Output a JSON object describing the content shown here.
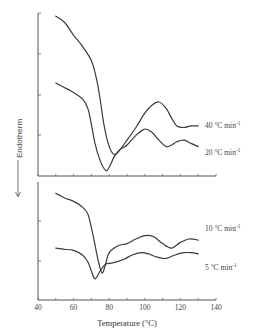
{
  "chart_data": {
    "type": "line",
    "title": "",
    "xlabel": "Temperature (°C)",
    "ylabel": "← Endotherm",
    "xlim": [
      40,
      140
    ],
    "x_ticks": [
      "40",
      "60",
      "80",
      "100",
      "120",
      "140"
    ],
    "grid": false,
    "panels": [
      {
        "position": "top",
        "series": [
          {
            "name": "40 °C min-1",
            "label": "40 °C min",
            "label_sup": "-1",
            "x": [
              50,
              55,
              60,
              65,
              70,
              73,
              75,
              77,
              80,
              83,
              86,
              90,
              95,
              100,
              104,
              108,
              112,
              115,
              118,
              122,
              126,
              130
            ],
            "y_rel": [
              0.98,
              0.94,
              0.86,
              0.79,
              0.7,
              0.58,
              0.45,
              0.3,
              0.16,
              0.11,
              0.14,
              0.2,
              0.28,
              0.37,
              0.42,
              0.44,
              0.4,
              0.34,
              0.29,
              0.28,
              0.29,
              0.29
            ]
          },
          {
            "name": "20 °C min-1",
            "label": "20 °C min",
            "label_sup": "-1",
            "x": [
              50,
              55,
              60,
              65,
              68,
              70,
              72,
              75,
              78,
              80,
              83,
              86,
              90,
              95,
              100,
              104,
              108,
              112,
              115,
              118,
              122,
              126,
              130
            ],
            "y_rel": [
              0.56,
              0.53,
              0.5,
              0.46,
              0.4,
              0.3,
              0.18,
              0.07,
              0.01,
              0.03,
              0.1,
              0.14,
              0.17,
              0.23,
              0.27,
              0.25,
              0.2,
              0.16,
              0.17,
              0.19,
              0.2,
              0.18,
              0.16
            ]
          }
        ]
      },
      {
        "position": "bottom",
        "series": [
          {
            "name": "10 °C min-1",
            "label": "10 °C min",
            "label_sup": "-1",
            "x": [
              50,
              55,
              60,
              65,
              68,
              70,
              72,
              74,
              76,
              78,
              80,
              85,
              90,
              95,
              100,
              105,
              110,
              115,
              120,
              125,
              130
            ],
            "y_rel": [
              0.9,
              0.86,
              0.83,
              0.78,
              0.72,
              0.6,
              0.45,
              0.3,
              0.2,
              0.28,
              0.38,
              0.44,
              0.46,
              0.5,
              0.53,
              0.52,
              0.46,
              0.42,
              0.47,
              0.5,
              0.49
            ]
          },
          {
            "name": "5 °C min-1",
            "label": "5 °C min",
            "label_sup": "-1",
            "x": [
              50,
              55,
              60,
              65,
              68,
              70,
              72,
              75,
              78,
              82,
              88,
              93,
              98,
              102,
              107,
              112,
              117,
              122,
              126,
              130
            ],
            "y_rel": [
              0.42,
              0.41,
              0.4,
              0.36,
              0.3,
              0.22,
              0.15,
              0.22,
              0.28,
              0.29,
              0.32,
              0.36,
              0.38,
              0.37,
              0.34,
              0.33,
              0.36,
              0.38,
              0.38,
              0.37
            ]
          }
        ]
      }
    ]
  },
  "axes": {
    "xlabel": "Temperature (°C)",
    "ylabel": "Endotherm",
    "x_ticks": [
      "40",
      "60",
      "80",
      "100",
      "120",
      "140"
    ]
  },
  "legend": {
    "s40": "40 °C min",
    "s20": "20 °C min",
    "s10": "10 °C min",
    "s5": "5 °C min",
    "sup": "-1"
  }
}
